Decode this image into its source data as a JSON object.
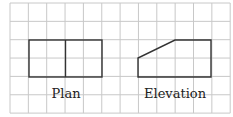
{
  "diagram": {
    "grid": {
      "x0": 10,
      "y0": 3,
      "cols": 12,
      "rows": 6,
      "cell": 18.35,
      "line_color": "#c8c8c8"
    },
    "shape_color": "#333333",
    "plan": {
      "label": "Plan",
      "label_pos": [
        66,
        98
      ],
      "rect": [
        29,
        40,
        102,
        77
      ],
      "divider_x": 65.5
    },
    "elevation": {
      "label": "Elevation",
      "label_pos": [
        175,
        98
      ],
      "points": "138,77 138,58 175,40 211,40 211,77"
    }
  }
}
